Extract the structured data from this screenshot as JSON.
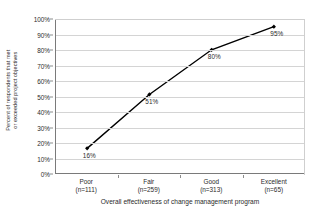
{
  "chart_data": {
    "type": "line",
    "title": "",
    "xlabel": "Overall effectiveness of change management program",
    "ylabel_line1": "Percent of respondents that met",
    "ylabel_line2": "or exceeded project objectives",
    "categories": [
      "Poor",
      "Fair",
      "Good",
      "Excellent"
    ],
    "category_sublabels": [
      "(n=111)",
      "(n=259)",
      "(n=313)",
      "(n=65)"
    ],
    "values": [
      16,
      51,
      80,
      95
    ],
    "data_labels": [
      "16%",
      "51%",
      "80%",
      "95%"
    ],
    "ylim": [
      0,
      100
    ],
    "ytick_values": [
      0,
      10,
      20,
      30,
      40,
      50,
      60,
      70,
      80,
      90,
      100
    ],
    "ytick_labels": [
      "0%",
      "10%",
      "20%",
      "30%",
      "40%",
      "50%",
      "60%",
      "70%",
      "80%",
      "90%",
      "100%"
    ],
    "grid": true,
    "legend": "none",
    "marker": "diamond",
    "series_color": "#000000",
    "grid_color": "#d4d4d4",
    "axis_color": "#7a7a7a",
    "background": "#ffffff"
  }
}
